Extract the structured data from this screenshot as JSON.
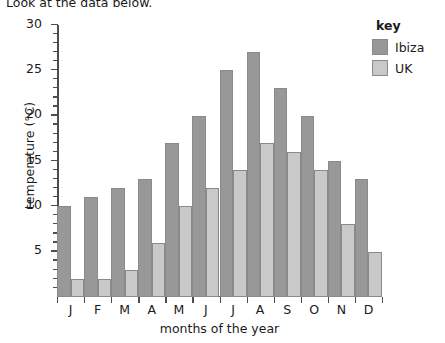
{
  "intro": {
    "text": "Look at the data below."
  },
  "legend": {
    "title": "key",
    "position": "top-right",
    "entries": [
      {
        "label": "Ibiza",
        "color": "#989898"
      },
      {
        "label": "UK",
        "color": "#c9c9c9"
      }
    ]
  },
  "chart_data": {
    "type": "bar",
    "title": "",
    "xlabel": "months of the year",
    "ylabel": "temperature (°C)",
    "categories": [
      "J",
      "F",
      "M",
      "A",
      "M",
      "J",
      "J",
      "A",
      "S",
      "O",
      "N",
      "D"
    ],
    "category_full_names": [
      "January",
      "February",
      "March",
      "April",
      "May",
      "June",
      "July",
      "August",
      "September",
      "October",
      "November",
      "December"
    ],
    "series": [
      {
        "name": "Ibiza",
        "color": "#989898",
        "values": [
          10,
          11,
          12,
          13,
          17,
          20,
          25,
          27,
          23,
          20,
          15,
          13
        ]
      },
      {
        "name": "UK",
        "color": "#c9c9c9",
        "values": [
          2,
          2,
          3,
          6,
          10,
          12,
          14,
          17,
          16,
          14,
          8,
          5
        ]
      }
    ],
    "ylim": [
      0,
      30
    ],
    "ytick_labels": [
      "5",
      "10",
      "15",
      "20",
      "25",
      "30"
    ],
    "ytick_values": [
      5,
      10,
      15,
      20,
      25,
      30
    ],
    "yminor_step": 1,
    "grid": false,
    "bar_gap": "none",
    "units": "°C"
  }
}
